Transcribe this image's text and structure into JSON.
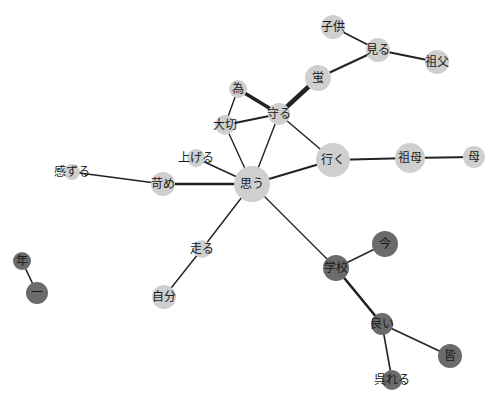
{
  "diagram": {
    "type": "co-occurrence-network",
    "width": 497,
    "height": 401,
    "colors": {
      "background": "#ffffff",
      "edge": "#222222",
      "group_light": "#cfcfcf",
      "group_dark": "#6b6b6b",
      "label": "#1a1a1a"
    },
    "nodes": [
      {
        "id": "kodomo",
        "label": "子供",
        "x": 333,
        "y": 27,
        "r": 12,
        "group": "light"
      },
      {
        "id": "miru",
        "label": "見る",
        "x": 378,
        "y": 50,
        "r": 12,
        "group": "light"
      },
      {
        "id": "sofu",
        "label": "祖父",
        "x": 437,
        "y": 62,
        "r": 12,
        "group": "light"
      },
      {
        "id": "hotaru",
        "label": "蛍",
        "x": 318,
        "y": 78,
        "r": 13,
        "group": "light"
      },
      {
        "id": "tame",
        "label": "為",
        "x": 238,
        "y": 89,
        "r": 9,
        "group": "light"
      },
      {
        "id": "mamoru",
        "label": "守る",
        "x": 279,
        "y": 114,
        "r": 11,
        "group": "light"
      },
      {
        "id": "taisetsu",
        "label": "大切",
        "x": 225,
        "y": 125,
        "r": 10,
        "group": "light"
      },
      {
        "id": "ageru",
        "label": "上げる",
        "x": 196,
        "y": 158,
        "r": 9,
        "group": "light"
      },
      {
        "id": "iku",
        "label": "行く",
        "x": 333,
        "y": 160,
        "r": 17,
        "group": "light"
      },
      {
        "id": "sobo",
        "label": "祖母",
        "x": 410,
        "y": 158,
        "r": 15,
        "group": "light"
      },
      {
        "id": "haha",
        "label": "母",
        "x": 474,
        "y": 157,
        "r": 11,
        "group": "light"
      },
      {
        "id": "kanzuru",
        "label": "感ずる",
        "x": 72,
        "y": 172,
        "r": 8,
        "group": "light"
      },
      {
        "id": "ijime",
        "label": "苛め",
        "x": 163,
        "y": 184,
        "r": 12,
        "group": "light"
      },
      {
        "id": "omou",
        "label": "思う",
        "x": 252,
        "y": 184,
        "r": 18,
        "group": "light"
      },
      {
        "id": "hashiru",
        "label": "走る",
        "x": 202,
        "y": 249,
        "r": 9,
        "group": "light"
      },
      {
        "id": "jibun",
        "label": "自分",
        "x": 164,
        "y": 297,
        "r": 12,
        "group": "light"
      },
      {
        "id": "toshi",
        "label": "年",
        "x": 22,
        "y": 261,
        "r": 9,
        "group": "dark"
      },
      {
        "id": "ichi",
        "label": "一",
        "x": 37,
        "y": 293,
        "r": 11,
        "group": "dark"
      },
      {
        "id": "ima",
        "label": "今",
        "x": 385,
        "y": 244,
        "r": 13,
        "group": "dark"
      },
      {
        "id": "gakkou",
        "label": "学校",
        "x": 336,
        "y": 268,
        "r": 13,
        "group": "dark"
      },
      {
        "id": "yoi",
        "label": "良い",
        "x": 382,
        "y": 324,
        "r": 11,
        "group": "dark"
      },
      {
        "id": "mina",
        "label": "皆",
        "x": 450,
        "y": 356,
        "r": 12,
        "group": "dark"
      },
      {
        "id": "kureru",
        "label": "呉れる",
        "x": 392,
        "y": 380,
        "r": 10,
        "group": "dark"
      }
    ],
    "edges": [
      {
        "source": "kodomo",
        "target": "miru",
        "width": 1.6
      },
      {
        "source": "miru",
        "target": "sofu",
        "width": 2.2
      },
      {
        "source": "miru",
        "target": "hotaru",
        "width": 2.2
      },
      {
        "source": "hotaru",
        "target": "mamoru",
        "width": 4.5
      },
      {
        "source": "tame",
        "target": "mamoru",
        "width": 3.5
      },
      {
        "source": "tame",
        "target": "taisetsu",
        "width": 1.4
      },
      {
        "source": "taisetsu",
        "target": "mamoru",
        "width": 2.2
      },
      {
        "source": "taisetsu",
        "target": "omou",
        "width": 1.4
      },
      {
        "source": "mamoru",
        "target": "omou",
        "width": 1.4
      },
      {
        "source": "mamoru",
        "target": "iku",
        "width": 1.4
      },
      {
        "source": "ageru",
        "target": "omou",
        "width": 1.6
      },
      {
        "source": "iku",
        "target": "omou",
        "width": 2.2
      },
      {
        "source": "iku",
        "target": "sobo",
        "width": 2.2
      },
      {
        "source": "sobo",
        "target": "haha",
        "width": 2.2
      },
      {
        "source": "kanzuru",
        "target": "ijime",
        "width": 1.4
      },
      {
        "source": "ijime",
        "target": "omou",
        "width": 2.4
      },
      {
        "source": "omou",
        "target": "hashiru",
        "width": 1.4
      },
      {
        "source": "hashiru",
        "target": "jibun",
        "width": 1.4
      },
      {
        "source": "omou",
        "target": "gakkou",
        "width": 1.4
      },
      {
        "source": "gakkou",
        "target": "ima",
        "width": 1.4
      },
      {
        "source": "gakkou",
        "target": "yoi",
        "width": 2.6
      },
      {
        "source": "yoi",
        "target": "mina",
        "width": 1.6
      },
      {
        "source": "yoi",
        "target": "kureru",
        "width": 1.6
      },
      {
        "source": "toshi",
        "target": "ichi",
        "width": 1.6
      }
    ]
  }
}
